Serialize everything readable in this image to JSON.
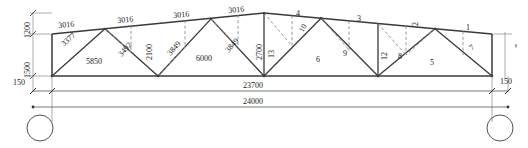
{
  "drawing": {
    "title": "steel-roof-truss-elevation",
    "type": "structural-truss-elevation",
    "units": "mm",
    "colors": {
      "line": "#3a3a3a",
      "thin": "#6b6b6b",
      "dashed": "#7a7a7a",
      "text": "#222222"
    }
  },
  "vertical_dimensions": [
    {
      "name": "rise-upper",
      "value": "1200"
    },
    {
      "name": "rise-lower",
      "value": "1500"
    }
  ],
  "end_offsets": {
    "left": "150",
    "right": "150"
  },
  "span_dimensions": [
    {
      "name": "inner-span",
      "value": "23700"
    },
    {
      "name": "outer-span",
      "value": "24000"
    }
  ],
  "member_lengths": {
    "top_chord": [
      "3016",
      "3016",
      "3016",
      "3016"
    ],
    "diagonals": [
      "3377",
      "3492",
      "3849",
      "3849"
    ],
    "verticals": [
      "2100",
      "2700"
    ],
    "bottom_chord": [
      "5850",
      "6000"
    ]
  },
  "member_numbers": {
    "top_chord": [
      "4",
      "3",
      "2",
      "1"
    ],
    "diagonals": [
      "10",
      "9",
      "8",
      "7"
    ],
    "verticals": [
      "13",
      "12"
    ],
    "bottom_chord": [
      "6",
      "5"
    ]
  },
  "labels": [
    {
      "name": "dim-1200",
      "text": "1200",
      "x": 24,
      "y": 30,
      "rot": -90
    },
    {
      "name": "dim-1500",
      "text": "1500",
      "x": 24,
      "y": 72,
      "rot": -90
    },
    {
      "name": "len-top-3016-1",
      "text": "3016",
      "x": 58,
      "y": 23,
      "rot": -9
    },
    {
      "name": "len-top-3016-2",
      "text": "3016",
      "x": 119,
      "y": 16,
      "rot": -9
    },
    {
      "name": "len-top-3016-3",
      "text": "3016",
      "x": 176,
      "y": 13,
      "rot": -9
    },
    {
      "name": "len-top-3016-4",
      "text": "3016",
      "x": 230,
      "y": 10,
      "rot": -9
    },
    {
      "name": "len-diag-3377",
      "text": "3377",
      "x": 61,
      "y": 40,
      "rot": 40
    },
    {
      "name": "len-diag-3492",
      "text": "3492",
      "x": 117,
      "y": 48,
      "rot": 45
    },
    {
      "name": "len-diag-3849-1",
      "text": "3849",
      "x": 167,
      "y": 44,
      "rot": 48
    },
    {
      "name": "len-diag-3849-2",
      "text": "3849",
      "x": 226,
      "y": 41,
      "rot": 48
    },
    {
      "name": "len-vert-2100",
      "text": "2100",
      "x": 148,
      "y": 56,
      "rot": -90
    },
    {
      "name": "len-vert-2700",
      "text": "2700",
      "x": 258,
      "y": 56,
      "rot": -90
    },
    {
      "name": "len-bot-5850",
      "text": "5850",
      "x": 86,
      "y": 62,
      "rot": 0
    },
    {
      "name": "len-bot-6000",
      "text": "6000",
      "x": 205,
      "y": 58,
      "rot": 0
    },
    {
      "name": "num-top-4",
      "text": "4",
      "x": 296,
      "y": 13,
      "rot": 0
    },
    {
      "name": "num-top-3",
      "text": "3",
      "x": 359,
      "y": 19,
      "rot": 0
    },
    {
      "name": "num-top-2",
      "text": "2",
      "x": 414,
      "y": 24,
      "rot": -90
    },
    {
      "name": "num-top-1",
      "text": "1",
      "x": 468,
      "y": 28,
      "rot": 0
    },
    {
      "name": "num-diag-10",
      "text": "10",
      "x": 300,
      "y": 33,
      "rot": -62
    },
    {
      "name": "num-diag-9",
      "text": "9",
      "x": 345,
      "y": 53,
      "rot": 0
    },
    {
      "name": "num-diag-8",
      "text": "8",
      "x": 400,
      "y": 54,
      "rot": 0
    },
    {
      "name": "num-diag-7",
      "text": "7",
      "x": 470,
      "y": 48,
      "rot": 38
    },
    {
      "name": "num-vert-13",
      "text": "13",
      "x": 270,
      "y": 54,
      "rot": -90
    },
    {
      "name": "num-vert-12",
      "text": "12",
      "x": 383,
      "y": 55,
      "rot": -90
    },
    {
      "name": "num-bot-6",
      "text": "6",
      "x": 316,
      "y": 60,
      "rot": 0
    },
    {
      "name": "num-bot-5",
      "text": "5",
      "x": 430,
      "y": 62,
      "rot": 0
    },
    {
      "name": "off-left-150",
      "text": "150",
      "x": 14,
      "y": 79,
      "rot": 0
    },
    {
      "name": "off-right-150",
      "text": "150",
      "x": 501,
      "y": 78,
      "rot": 0
    },
    {
      "name": "span-23700",
      "text": "23700",
      "x": 246,
      "y": 85,
      "rot": 0
    },
    {
      "name": "span-24000",
      "text": "24000",
      "x": 246,
      "y": 101,
      "rot": 0
    },
    {
      "name": "right-edge-mark",
      "text": "=",
      "x": 500,
      "y": 48,
      "rot": 0
    }
  ],
  "supports": [
    {
      "name": "support-left",
      "shape": "circle"
    },
    {
      "name": "support-right",
      "shape": "circle"
    }
  ]
}
